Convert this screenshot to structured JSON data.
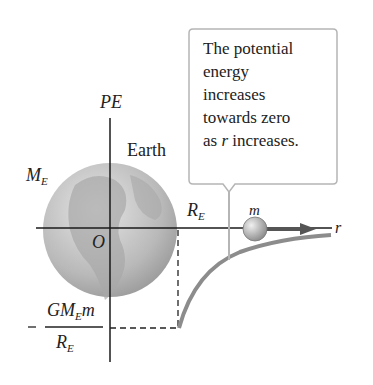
{
  "labels": {
    "pe_axis": "PE",
    "r_axis": "r",
    "origin": "O",
    "earth": "Earth",
    "mass_earth": "M",
    "mass_earth_sub": "E",
    "radius": "R",
    "radius_sub": "E",
    "mass": "m",
    "fraction_num_a": "GM",
    "fraction_num_sub": "E",
    "fraction_num_b": "m",
    "fraction_den": "R",
    "fraction_den_sub": "E",
    "minus": "−"
  },
  "callout": {
    "lines": [
      "The potential",
      "energy",
      "increases",
      "towards zero"
    ],
    "last_a": "as ",
    "last_r": "r",
    "last_b": " increases."
  },
  "colors": {
    "axis": "#1a1a1a",
    "curve": "#8c8c8c",
    "callout_border": "#b5b5b5",
    "arrow": "#555555"
  }
}
